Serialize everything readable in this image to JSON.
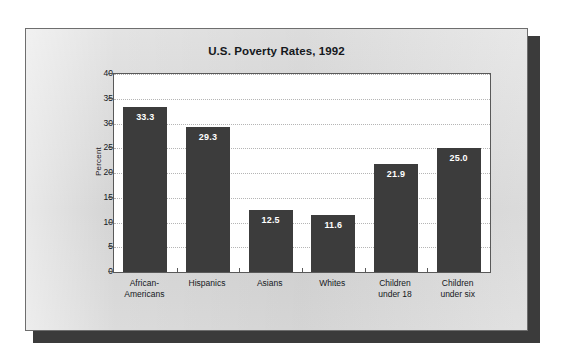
{
  "chart_data": {
    "type": "bar",
    "title": "U.S. Poverty Rates, 1992",
    "xlabel": "",
    "ylabel": "Percent",
    "categories": [
      "African-\nAmericans",
      "Hispanics",
      "Asians",
      "Whites",
      "Children\nunder 18",
      "Children\nunder six"
    ],
    "category_lines": [
      [
        "African-",
        "Americans"
      ],
      [
        "Hispanics",
        ""
      ],
      [
        "Asians",
        ""
      ],
      [
        "Whites",
        ""
      ],
      [
        "Children",
        "under 18"
      ],
      [
        "Children",
        "under six"
      ]
    ],
    "values": [
      33.3,
      29.3,
      12.5,
      11.6,
      21.9,
      25.0
    ],
    "value_labels": [
      "33.3",
      "29.3",
      "12.5",
      "11.6",
      "21.9",
      "25.0"
    ],
    "ylim": [
      0,
      40
    ],
    "ytick_step": 5,
    "ytick_labels": [
      "40",
      "35",
      "30",
      "25",
      "20",
      "15",
      "10",
      "5",
      "0"
    ],
    "grid": true,
    "grid_style": "dotted",
    "legend": "none",
    "bar_color": "#3c3c3c",
    "plot_background": "#ffffff",
    "card_background": "#d7d7d7",
    "value_label_color": "#ffffff",
    "axis_color": "#595959"
  }
}
